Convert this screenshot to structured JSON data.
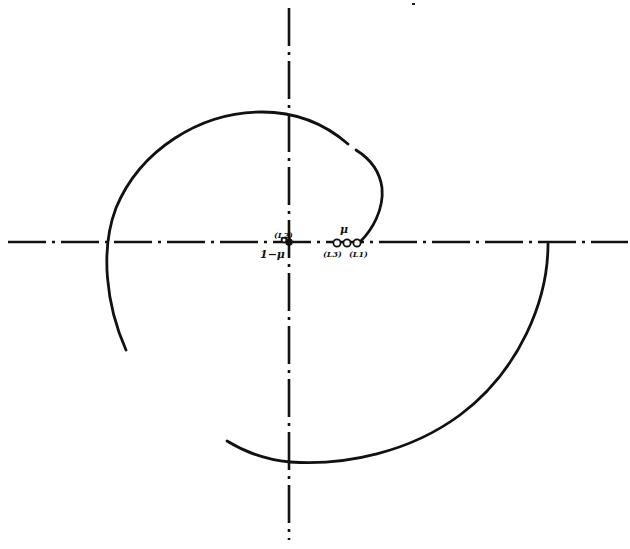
{
  "figure": {
    "colors": {
      "ink": "#111111",
      "background": "#ffffff"
    },
    "axes": {
      "horizontal": {
        "style": "dash-dot",
        "y": 242,
        "x_from": 8,
        "x_to": 628
      },
      "vertical": {
        "style": "dash-dot",
        "x": 289,
        "y_from": 8,
        "y_to": 540
      }
    },
    "labels": {
      "origin_above": "(L2)",
      "origin_below": "1−μ",
      "mu": "μ",
      "left_point_below": "(L3)",
      "right_point_below": "(L1)"
    },
    "points": [
      {
        "name": "mass-1-mu",
        "x": 289,
        "y": 242
      },
      {
        "name": "lagrange-point-left",
        "x": 337,
        "y": 243
      },
      {
        "name": "mass-mu",
        "x": 347,
        "y": 243
      },
      {
        "name": "lagrange-point-right",
        "x": 357,
        "y": 243
      }
    ],
    "curves": [
      {
        "name": "inner-spiral-arc",
        "from": [
          360,
          242
        ],
        "to": [
          126,
          350
        ],
        "gap_near": [
          350,
          147
        ]
      },
      {
        "name": "outer-spiral-arc",
        "from": [
          548,
          243
        ],
        "to": [
          227,
          441
        ]
      }
    ]
  }
}
